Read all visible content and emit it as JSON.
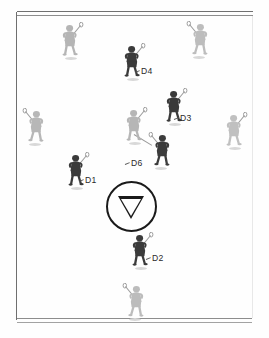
{
  "diagram": {
    "field": {
      "border_color": "#6d6d6d",
      "background_color": "#fefefe"
    },
    "center_marker": {
      "name": "face-off-circle",
      "shape": "circle-with-down-triangle",
      "color": "#1a1a1a",
      "cx": 131.5,
      "cy": 206.5,
      "r": 25.5
    },
    "teams": {
      "defense_color": "#3a3a3a",
      "offense_color": "#b9b9b9"
    },
    "players": [
      {
        "id": "A1",
        "team": "offense",
        "label": "",
        "x": 58,
        "y": 22,
        "shade": "#b5b5b5"
      },
      {
        "id": "A2",
        "team": "offense",
        "label": "",
        "x": 186,
        "y": 21,
        "shade": "#bdbdbd"
      },
      {
        "id": "D4",
        "team": "defense",
        "label": "D4",
        "x": 120,
        "y": 43,
        "shade": "#3b3b3b"
      },
      {
        "id": "D3",
        "team": "defense",
        "label": "D3",
        "x": 162,
        "y": 88,
        "shade": "#3a3a3a"
      },
      {
        "id": "A3",
        "team": "offense",
        "label": "",
        "x": 22,
        "y": 108,
        "shade": "#b7b7b7"
      },
      {
        "id": "A4",
        "team": "offense",
        "label": "",
        "x": 122,
        "y": 107,
        "shade": "#b6b6b6"
      },
      {
        "id": "A5",
        "team": "offense",
        "label": "",
        "x": 222,
        "y": 112,
        "shade": "#c0c0c0"
      },
      {
        "id": "D6",
        "team": "defense",
        "label": "D6",
        "x": 148,
        "y": 132,
        "shade": "#3c3c3c"
      },
      {
        "id": "D1",
        "team": "defense",
        "label": "D1",
        "x": 64,
        "y": 152,
        "shade": "#3a3a3a"
      },
      {
        "id": "D2",
        "team": "defense",
        "label": "D2",
        "x": 128,
        "y": 232,
        "shade": "#3b3b3b"
      },
      {
        "id": "A6",
        "team": "offense",
        "label": "",
        "x": 122,
        "y": 283,
        "shade": "#bcbcbc"
      }
    ],
    "labels": [
      {
        "text": "D4",
        "x": 141,
        "y": 66
      },
      {
        "text": "D3",
        "x": 180,
        "y": 113
      },
      {
        "text": "D6",
        "x": 131,
        "y": 158
      },
      {
        "text": "D1",
        "x": 85,
        "y": 175
      },
      {
        "text": "D2",
        "x": 152,
        "y": 253
      }
    ],
    "connectors": [
      {
        "name": "stick-connection-d6",
        "x1": 134,
        "y1": 134,
        "x2": 152,
        "y2": 145
      }
    ]
  }
}
